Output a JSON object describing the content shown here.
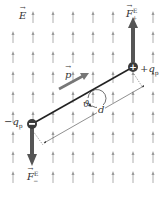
{
  "diagram": {
    "field_label": "E",
    "dipole_moment_label": "p",
    "angle_label": "ϑ",
    "separation_label": "d",
    "positive_charge": {
      "sign": "+",
      "label": "+q",
      "label_sub": "p"
    },
    "negative_charge": {
      "sign": "−",
      "label": "−q",
      "label_sub": "p"
    },
    "force_positive": {
      "label": "F",
      "sup": "E",
      "sub": "+"
    },
    "force_negative": {
      "label": "F",
      "sup": "E",
      "sub": "−"
    },
    "colors": {
      "field_arrow": "#9a9a9a",
      "force_arrow": "#555555",
      "dipole_arrow": "#6e6e6e",
      "rod": "#222222",
      "charge_fill": "#3a3a3a"
    },
    "field_grid": {
      "columns_x": [
        13,
        33,
        53,
        73,
        93,
        113,
        133,
        153
      ],
      "rows_y": [
        17,
        37,
        57,
        77,
        97,
        117,
        137,
        157,
        177
      ]
    }
  }
}
